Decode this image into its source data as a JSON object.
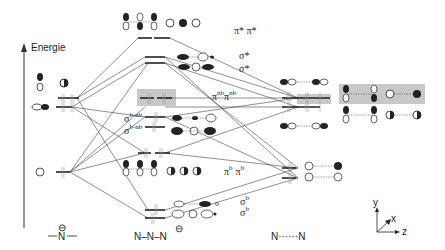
{
  "axis": {
    "energy_label": "Energie"
  },
  "columns": {
    "left": {
      "label": "N",
      "charge": "⊖"
    },
    "middle": {
      "label": "N–N–N",
      "charge": "⊖"
    },
    "right": {
      "label": "N······N"
    }
  },
  "orbital_labels": {
    "pi_star": "π* π*",
    "sigma_star_1": "σ*",
    "sigma_star_2": "σ*",
    "pi_nb": "π",
    "pi_nb_sup": "nb",
    "sigma_bnb_1": "σ",
    "sigma_bnb_sup": "b-nb",
    "sigma_bnb_2": "σ",
    "pi_b": "π",
    "pi_b_sup": "b",
    "sigma_b_1": "σ",
    "sigma_b_sup": "b",
    "sigma_b_2": "σ"
  },
  "coordinate_axes": {
    "x": "x",
    "y": "y",
    "z": "z"
  },
  "colors": {
    "line": "#333333",
    "highlight": "#c8c8c8",
    "electron": "#888888"
  }
}
